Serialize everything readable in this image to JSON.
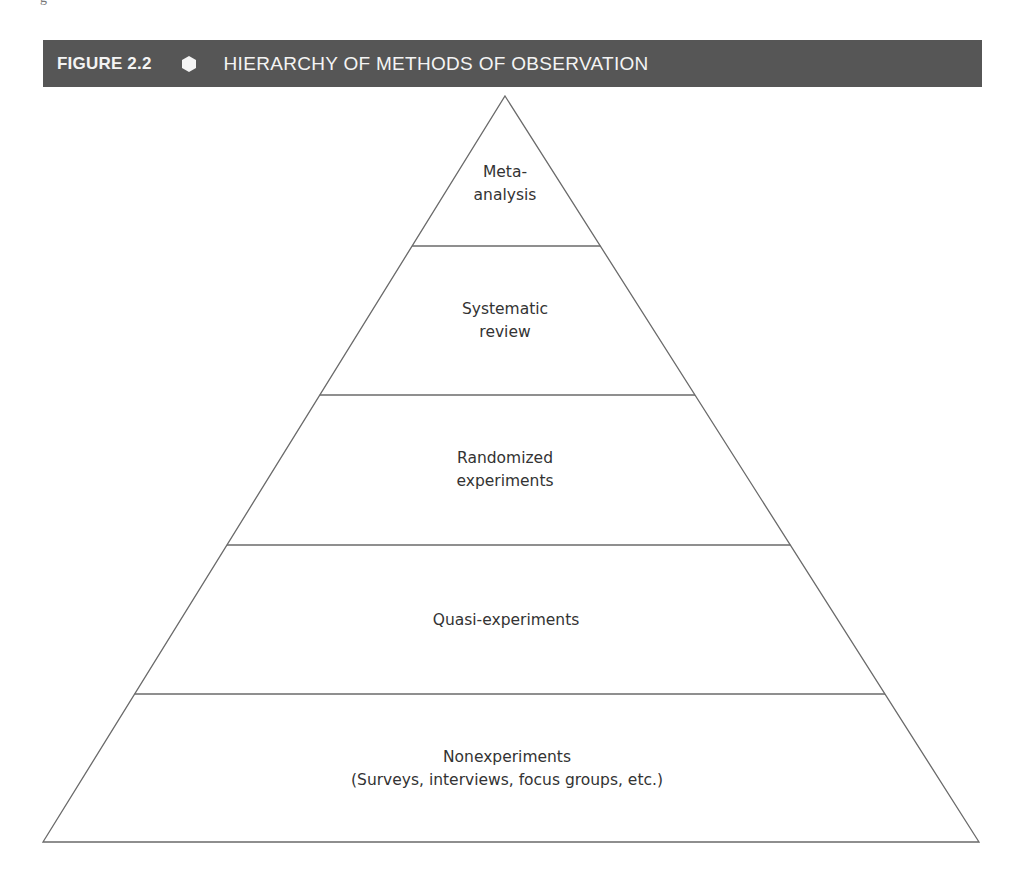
{
  "page_fragment": "g",
  "figure": {
    "number": "FIGURE 2.2",
    "separator_icon": "hexagon-icon",
    "title": "HIERARCHY OF METHODS OF OBSERVATION",
    "header_color": "#565656",
    "header_text_color": "#f4f4f4"
  },
  "pyramid": {
    "apex": [
      505,
      96
    ],
    "base_left": [
      43,
      842
    ],
    "base_right": [
      979,
      842
    ],
    "stroke_color": "#6a6a6a",
    "levels": [
      {
        "name": "meta-analysis",
        "lines": [
          "Meta-",
          "analysis"
        ],
        "center": [
          505,
          184
        ]
      },
      {
        "name": "systematic-review",
        "lines": [
          "Systematic",
          "review"
        ],
        "center": [
          505,
          321
        ]
      },
      {
        "name": "randomized-experiments",
        "lines": [
          "Randomized",
          "experiments"
        ],
        "center": [
          505,
          470
        ]
      },
      {
        "name": "quasi-experiments",
        "lines": [
          "Quasi-experiments"
        ],
        "center": [
          506,
          620
        ]
      },
      {
        "name": "nonexperiments",
        "lines": [
          "Nonexperiments",
          "(Surveys, interviews, focus groups, etc.)"
        ],
        "center": [
          507,
          769
        ]
      }
    ],
    "dividers_y": [
      246,
      395,
      545,
      694
    ]
  }
}
